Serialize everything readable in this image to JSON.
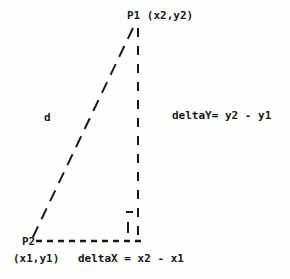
{
  "figure": {
    "width": 290,
    "height": 279,
    "background_color": "#fefefe",
    "ink_color": "#181818"
  },
  "labels": {
    "point_p1": "P1 (x2,y2)",
    "point_p2": "P2",
    "point_p2_coords": "(x1,y1)",
    "hypotenuse": "d",
    "delta_y": "deltaY= y2 - y1",
    "delta_x": "deltaX = x2 - x1"
  },
  "geometry": {
    "p1": {
      "x": 133,
      "y": 28
    },
    "p2": {
      "x": 32,
      "y": 239
    },
    "corner": {
      "x": 138,
      "y": 239
    },
    "hypotenuse_dash": "12 8",
    "vertical_dash": "9 9",
    "horizontal_dash": "6 5",
    "stroke_width": 2,
    "right_angle_marker": {
      "horizontal_tick_x1": 126,
      "horizontal_tick_x2": 133,
      "horizontal_tick_y": 212,
      "vertical_tick_x": 128,
      "vertical_tick_y1": 222,
      "vertical_tick_y2": 233
    }
  }
}
